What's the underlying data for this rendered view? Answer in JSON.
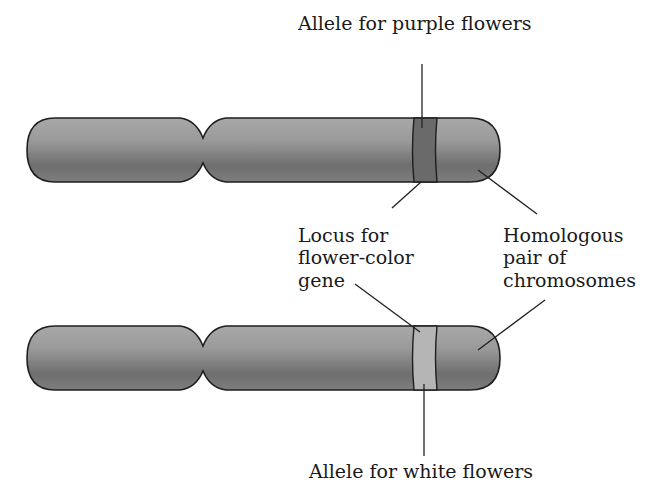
{
  "labels": {
    "purple_allele": "Allele for purple flowers",
    "locus": [
      "Locus for",
      "flower-color",
      "gene"
    ],
    "homologous": [
      "Homologous",
      "pair of",
      "chromosomes"
    ],
    "white_allele": "Allele for white flowers"
  },
  "chromosomes": [
    {
      "name": "top",
      "band_color": "#6a6a6a",
      "band_label": "purple"
    },
    {
      "name": "bottom",
      "band_color": "#b5b5b5",
      "band_label": "white"
    }
  ],
  "colors": {
    "chromosome_body": "#8a8a8a",
    "outline": "#1e1e1e",
    "text": "#1a1a1a"
  }
}
